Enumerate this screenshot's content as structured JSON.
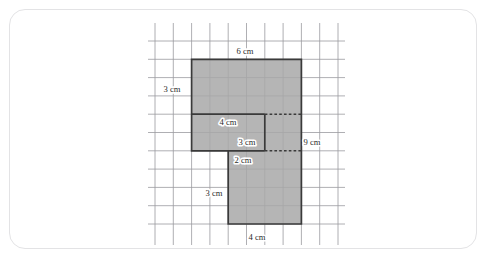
{
  "page": {
    "background_color": "#ffffff",
    "card_border_color": "#e3e3e5"
  },
  "caption": "",
  "figure": {
    "name": "compound-shape-on-grid",
    "grid": {
      "cell_size_cm": 1,
      "columns": 10,
      "rows": 11,
      "line_color": "#9a9aa0",
      "origin_px": {
        "x": 155,
        "y": 41
      },
      "cell_px": 18.3
    },
    "shape": {
      "fill_color": "#a8a8a8",
      "outline_color": "#3a3a3a",
      "vertices_cells": [
        [
          2,
          1
        ],
        [
          8,
          1
        ],
        [
          8,
          10
        ],
        [
          4,
          10
        ],
        [
          4,
          6
        ],
        [
          2,
          6
        ]
      ],
      "interior_dashed_segments_cells": [
        [
          [
            6,
            4
          ],
          [
            8,
            4
          ]
        ],
        [
          [
            6,
            6
          ],
          [
            8,
            6
          ]
        ]
      ],
      "interior_solid_segments_cells": [
        [
          [
            2,
            4
          ],
          [
            6,
            4
          ]
        ],
        [
          [
            6,
            4
          ],
          [
            6,
            6
          ]
        ],
        [
          [
            4,
            6
          ],
          [
            6,
            6
          ]
        ]
      ]
    },
    "labels": [
      {
        "id": "top-width",
        "text": "6 cm",
        "value": 6,
        "unit": "cm",
        "edge": "top",
        "x": 245,
        "y": 54
      },
      {
        "id": "left-height",
        "text": "3 cm",
        "value": 3,
        "unit": "cm",
        "edge": "upper-left",
        "x": 172,
        "y": 92
      },
      {
        "id": "inner-width",
        "text": "4 cm",
        "value": 4,
        "unit": "cm",
        "edge": "inner-horizontal-upper",
        "x": 228,
        "y": 125
      },
      {
        "id": "inner-height",
        "text": "3 cm",
        "value": 3,
        "unit": "cm",
        "edge": "inner-vertical",
        "x": 247,
        "y": 145
      },
      {
        "id": "inner-width-lower",
        "text": "2 cm",
        "value": 2,
        "unit": "cm",
        "edge": "inner-horizontal-lower",
        "x": 243,
        "y": 163
      },
      {
        "id": "right-height",
        "text": "9 cm",
        "value": 9,
        "unit": "cm",
        "edge": "right",
        "x": 312,
        "y": 145
      },
      {
        "id": "lower-left-height",
        "text": "3 cm",
        "value": 3,
        "unit": "cm",
        "edge": "lower-left",
        "x": 214,
        "y": 196
      },
      {
        "id": "bottom-width",
        "text": "4 cm",
        "value": 4,
        "unit": "cm",
        "edge": "bottom",
        "x": 257,
        "y": 240
      }
    ]
  }
}
